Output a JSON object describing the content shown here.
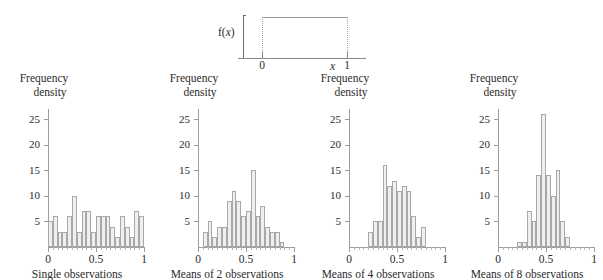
{
  "figure": {
    "y_axis_label_line1": "Frequency",
    "y_axis_label_line2": "density",
    "y_ticks": [
      5,
      10,
      15,
      20,
      25
    ],
    "x_ticks": [
      "0",
      "0.5",
      "1"
    ],
    "bar_fill_color": "#efefef",
    "bar_stroke_color": "#a8a8a8",
    "axis_color": "#9d9d9d"
  },
  "top_panel": {
    "density_label": "f(",
    "density_label_var": "x",
    "density_label_close": ")",
    "x_var": "x",
    "x_tick_left": "0",
    "x_tick_right": "1",
    "description": "uniform density on 0 to 1"
  },
  "chart_data": [
    {
      "type": "line",
      "title": "Uniform parent distribution",
      "xlabel": "x",
      "ylabel": "f(x)",
      "xlim": [
        -0.28,
        1.22
      ],
      "ylim": [
        0,
        1.35
      ],
      "x": [
        0,
        1
      ],
      "values": [
        1,
        1
      ],
      "xtick_labels": [
        "0",
        "1"
      ],
      "grid": false,
      "legend": "none"
    },
    {
      "type": "bar",
      "title": "Single observations",
      "xlabel": "",
      "ylabel": "Frequency density",
      "xlim": [
        0,
        1
      ],
      "ylim": [
        0,
        27
      ],
      "ytick_labels": [
        5,
        10,
        15,
        20,
        25
      ],
      "xtick_labels": [
        "0",
        "0.5",
        "1"
      ],
      "bin_width": 0.05,
      "bin_starts": [
        0.0,
        0.05,
        0.1,
        0.15,
        0.2,
        0.25,
        0.3,
        0.35,
        0.4,
        0.45,
        0.5,
        0.55,
        0.6,
        0.65,
        0.7,
        0.75,
        0.8,
        0.85,
        0.9,
        0.95
      ],
      "values": [
        5,
        6,
        3,
        3,
        6,
        10,
        3,
        7,
        7,
        3,
        6,
        6,
        6,
        4,
        2,
        6,
        4,
        2,
        7,
        6
      ],
      "grid": false,
      "legend": "none"
    },
    {
      "type": "bar",
      "title": "Means of 2 observations",
      "xlabel": "",
      "ylabel": "Frequency density",
      "xlim": [
        0,
        1
      ],
      "ylim": [
        0,
        27
      ],
      "ytick_labels": [
        5,
        10,
        15,
        20,
        25
      ],
      "xtick_labels": [
        "0",
        "0.5",
        "1"
      ],
      "bin_width": 0.05,
      "bin_starts": [
        0.05,
        0.1,
        0.15,
        0.2,
        0.25,
        0.3,
        0.35,
        0.4,
        0.45,
        0.5,
        0.55,
        0.6,
        0.65,
        0.7,
        0.75,
        0.8,
        0.85
      ],
      "values": [
        3,
        5,
        2,
        4,
        4,
        9,
        11,
        9,
        6,
        7,
        15,
        6,
        8,
        4,
        3,
        3,
        1
      ],
      "grid": false,
      "legend": "none"
    },
    {
      "type": "bar",
      "title": "Means of 4 observations",
      "xlabel": "",
      "ylabel": "Frequency density",
      "xlim": [
        0,
        1
      ],
      "ylim": [
        0,
        27
      ],
      "ytick_labels": [
        5,
        10,
        15,
        20,
        25
      ],
      "xtick_labels": [
        "0",
        "0.5",
        "1"
      ],
      "bin_width": 0.05,
      "bin_starts": [
        0.2,
        0.25,
        0.3,
        0.35,
        0.4,
        0.45,
        0.5,
        0.55,
        0.6,
        0.65,
        0.7,
        0.75
      ],
      "values": [
        3,
        5,
        5,
        16,
        12,
        13,
        11,
        12,
        11,
        6,
        2,
        4
      ],
      "grid": false,
      "legend": "none"
    },
    {
      "type": "bar",
      "title": "Means of 8 observations",
      "xlabel": "",
      "ylabel": "Frequency density",
      "xlim": [
        0,
        1
      ],
      "ylim": [
        0,
        27
      ],
      "ytick_labels": [
        5,
        10,
        15,
        20,
        25
      ],
      "xtick_labels": [
        "0",
        "0.5",
        "1"
      ],
      "bin_width": 0.05,
      "bin_starts": [
        0.2,
        0.25,
        0.3,
        0.35,
        0.4,
        0.45,
        0.5,
        0.55,
        0.6,
        0.65,
        0.7
      ],
      "values": [
        1,
        1,
        7,
        5,
        14,
        26,
        14,
        10,
        15,
        5,
        2
      ],
      "grid": false,
      "legend": "none"
    }
  ]
}
